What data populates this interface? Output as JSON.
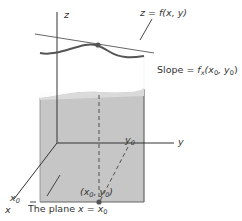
{
  "labels": {
    "z_axis": "z",
    "y_axis": "y",
    "x_axis": "x",
    "surface": "z = f(x, y)",
    "slope_prefix": "Slope = ",
    "slope_f": "f",
    "slope_sub": "x",
    "slope_args_open": "(x",
    "slope_args_mid": ", y",
    "slope_args_close": ")",
    "sub0": "0",
    "x0": "x",
    "y0": "y",
    "point_open": "(x",
    "point_mid": ", y",
    "point_close": ")",
    "plane_prefix": "The plane ",
    "plane_eq": "x = x"
  },
  "colors": {
    "plane_fill": "#c8c8c8",
    "plane_edge": "#555555",
    "curve": "#555555",
    "axis": "#333333",
    "point": "#555555"
  }
}
